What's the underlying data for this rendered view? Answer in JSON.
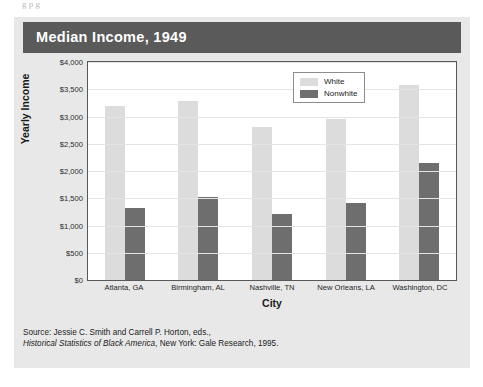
{
  "top_bleed_text": "g             p                g",
  "card": {
    "title": "Median Income, 1949"
  },
  "source": {
    "line1": "Source: Jessie C. Smith and Carrell P. Horton, eds.,",
    "line2_italic": "Historical Statistics of Black America",
    "line2_rest": ", New York: Gale Research, 1995."
  },
  "legend": {
    "items": [
      {
        "label": "White",
        "color": "#dcdcdc"
      },
      {
        "label": "Nonwhite",
        "color": "#6e6e6e"
      }
    ]
  },
  "chart_data": {
    "type": "bar",
    "title": "Median Income, 1949",
    "xlabel": "City",
    "ylabel": "Yearly Income",
    "ylim": [
      0,
      4000
    ],
    "ytick_values": [
      4000,
      3500,
      3000,
      2500,
      2000,
      1500,
      1000,
      500,
      0
    ],
    "ytick_labels": [
      "$4,000",
      "$3,500",
      "$3,000",
      "$2,500",
      "$2,000",
      "$1,500",
      "$1,000",
      "$500",
      "$0"
    ],
    "grid": true,
    "legend_position": "top-center",
    "categories": [
      "Atlanta, GA",
      "Birmingham, AL",
      "Nashville, TN",
      "New Orleans, LA",
      "Washington, DC"
    ],
    "series": [
      {
        "name": "White",
        "color": "#dcdcdc",
        "values": [
          3200,
          3280,
          2800,
          2960,
          3580
        ]
      },
      {
        "name": "Nonwhite",
        "color": "#6e6e6e",
        "values": [
          1330,
          1530,
          1210,
          1420,
          2150
        ]
      }
    ]
  }
}
